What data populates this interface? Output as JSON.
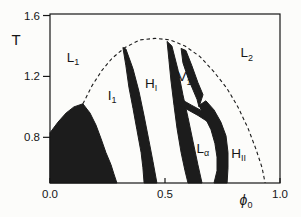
{
  "figure": {
    "background": "#fcfcfa",
    "ink": "#161616",
    "line_color": "#1c1c1c"
  },
  "chart_data": {
    "type": "line",
    "xlabel": {
      "main": "ϕ",
      "sub": "0"
    },
    "ylabel": "T",
    "xlim": [
      0.0,
      1.0
    ],
    "ylim": [
      0.5,
      1.61
    ],
    "grid": false,
    "x_ticks": [
      {
        "label": "0.0",
        "value": 0.0
      },
      {
        "label": "0.5",
        "value": 0.5
      },
      {
        "label": "1.0",
        "value": 1.0
      }
    ],
    "y_ticks": [
      {
        "label": "0.8",
        "value": 0.8
      },
      {
        "label": "1.2",
        "value": 1.2
      },
      {
        "label": "1.6",
        "value": 1.6
      }
    ],
    "region_labels": [
      {
        "name": "region-L1",
        "main": "L",
        "sub": "1",
        "phi": 0.1,
        "T": 1.33
      },
      {
        "name": "region-I1",
        "main": "I",
        "sub": "1",
        "phi": 0.27,
        "T": 1.08
      },
      {
        "name": "region-HI",
        "main": "H",
        "sub": "I",
        "phi": 0.44,
        "T": 1.16
      },
      {
        "name": "region-V1",
        "main": "V",
        "sub": "1",
        "phi": 0.585,
        "T": 1.2
      },
      {
        "name": "region-L2",
        "main": "L",
        "sub": "2",
        "phi": 0.855,
        "T": 1.36
      },
      {
        "name": "region-Lalpha",
        "main": "L",
        "sub": "α",
        "phi": 0.665,
        "T": 0.73
      },
      {
        "name": "region-HII",
        "main": "H",
        "sub": "II",
        "phi": 0.82,
        "T": 0.7
      }
    ],
    "series": [
      {
        "name": "binodal-dashed-curve",
        "style": "dashed",
        "points": [
          [
            0.143,
            1.02
          ],
          [
            0.183,
            1.14
          ],
          [
            0.226,
            1.24
          ],
          [
            0.27,
            1.32
          ],
          [
            0.326,
            1.39
          ],
          [
            0.391,
            1.44
          ],
          [
            0.457,
            1.45
          ],
          [
            0.522,
            1.44
          ],
          [
            0.587,
            1.4
          ],
          [
            0.652,
            1.33
          ],
          [
            0.713,
            1.23
          ],
          [
            0.77,
            1.12
          ],
          [
            0.817,
            1.0
          ],
          [
            0.861,
            0.86
          ],
          [
            0.896,
            0.72
          ],
          [
            0.922,
            0.6
          ],
          [
            0.935,
            0.5
          ]
        ]
      }
    ],
    "filled_regions": [
      {
        "name": "solid-crystal-region",
        "points": [
          [
            0.0,
            0.83
          ],
          [
            0.035,
            0.9
          ],
          [
            0.07,
            0.96
          ],
          [
            0.104,
            1.0
          ],
          [
            0.143,
            1.02
          ],
          [
            0.174,
            0.96
          ],
          [
            0.2,
            0.88
          ],
          [
            0.222,
            0.79
          ],
          [
            0.243,
            0.7
          ],
          [
            0.265,
            0.62
          ],
          [
            0.278,
            0.56
          ],
          [
            0.291,
            0.5
          ],
          [
            0.0,
            0.5
          ]
        ]
      },
      {
        "name": "band-I1-HI",
        "points": [
          [
            0.317,
            1.39
          ],
          [
            0.33,
            1.27
          ],
          [
            0.343,
            1.13
          ],
          [
            0.361,
            0.99
          ],
          [
            0.378,
            0.85
          ],
          [
            0.396,
            0.7
          ],
          [
            0.404,
            0.6
          ],
          [
            0.409,
            0.5
          ],
          [
            0.465,
            0.5
          ],
          [
            0.448,
            0.64
          ],
          [
            0.43,
            0.78
          ],
          [
            0.409,
            0.94
          ],
          [
            0.387,
            1.1
          ],
          [
            0.361,
            1.25
          ],
          [
            0.33,
            1.38
          ]
        ]
      },
      {
        "name": "band-HI-Lalpha",
        "points": [
          [
            0.509,
            1.43
          ],
          [
            0.517,
            1.31
          ],
          [
            0.526,
            1.17
          ],
          [
            0.539,
            1.01
          ],
          [
            0.552,
            0.86
          ],
          [
            0.57,
            0.7
          ],
          [
            0.587,
            0.58
          ],
          [
            0.6,
            0.5
          ],
          [
            0.661,
            0.5
          ],
          [
            0.643,
            0.62
          ],
          [
            0.622,
            0.77
          ],
          [
            0.6,
            0.93
          ],
          [
            0.578,
            1.08
          ],
          [
            0.557,
            1.24
          ],
          [
            0.53,
            1.4
          ]
        ]
      },
      {
        "name": "band-V1-right-edge",
        "points": [
          [
            0.57,
            1.384
          ],
          [
            0.578,
            1.29
          ],
          [
            0.6,
            1.19
          ],
          [
            0.622,
            1.11
          ],
          [
            0.639,
            1.05
          ],
          [
            0.648,
            1.0
          ],
          [
            0.665,
            1.08
          ],
          [
            0.643,
            1.16
          ],
          [
            0.617,
            1.27
          ],
          [
            0.591,
            1.37
          ]
        ]
      },
      {
        "name": "band-V1-Lalpha-fork",
        "points": [
          [
            0.548,
            1.062
          ],
          [
            0.578,
            1.043
          ],
          [
            0.617,
            1.01
          ],
          [
            0.657,
            0.977
          ],
          [
            0.691,
            0.938
          ],
          [
            0.683,
            0.905
          ],
          [
            0.643,
            0.944
          ],
          [
            0.604,
            0.977
          ],
          [
            0.565,
            1.01
          ],
          [
            0.539,
            1.03
          ]
        ]
      },
      {
        "name": "band-Lalpha-HII",
        "points": [
          [
            0.648,
            1.01
          ],
          [
            0.674,
            0.93
          ],
          [
            0.7,
            0.85
          ],
          [
            0.717,
            0.76
          ],
          [
            0.726,
            0.67
          ],
          [
            0.726,
            0.58
          ],
          [
            0.713,
            0.5
          ],
          [
            0.77,
            0.5
          ],
          [
            0.774,
            0.6
          ],
          [
            0.774,
            0.7
          ],
          [
            0.765,
            0.81
          ],
          [
            0.743,
            0.9
          ],
          [
            0.713,
            0.98
          ],
          [
            0.678,
            1.04
          ]
        ]
      }
    ],
    "layout": {
      "canvas": {
        "width": 301,
        "height": 217
      },
      "plot_box": {
        "left": 50,
        "top": 14,
        "right": 280,
        "bottom": 183
      }
    }
  }
}
